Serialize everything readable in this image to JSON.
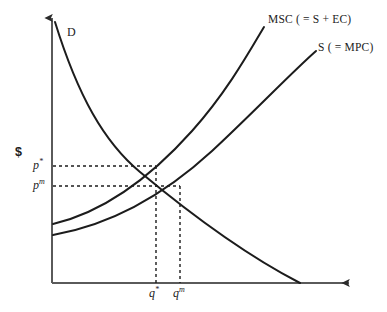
{
  "figure": {
    "title_internal": "negative-externality-supply-demand-diagram",
    "background_color": "#ffffff",
    "ink_color": "#1c1c1c"
  },
  "axes": {
    "y_label": "$",
    "x_label": "",
    "origin": {
      "x": 52,
      "y": 283
    },
    "y_top": {
      "x": 52,
      "y": 11
    },
    "x_right": {
      "x": 356,
      "y": 283
    },
    "arrowheads": [
      "y-axis-top",
      "x-axis-right"
    ]
  },
  "curves": [
    {
      "id": "demand",
      "label": "D",
      "label_x": 67,
      "label_y": 32,
      "kind": "downward-sloping-convex",
      "start": {
        "x": 55,
        "y": 22
      },
      "end": {
        "x": 300,
        "y": 283
      }
    },
    {
      "id": "marginal-social-cost",
      "label": "MSC ( = S + EC)",
      "label_x": 268,
      "label_y": 19,
      "kind": "upward-sloping-convex",
      "start": {
        "x": 53,
        "y": 224
      },
      "end": {
        "x": 264,
        "y": 27
      }
    },
    {
      "id": "supply-marginal-private-cost",
      "label": "S ( = MPC)",
      "label_x": 318,
      "label_y": 47,
      "kind": "upward-sloping-convex",
      "start": {
        "x": 53,
        "y": 235
      },
      "end": {
        "x": 316,
        "y": 51
      }
    }
  ],
  "equilibria": [
    {
      "id": "social-optimum",
      "price_label": "p",
      "price_superscript": "*",
      "quantity_label": "q",
      "quantity_superscript": "*",
      "point": {
        "x": 156,
        "y": 166
      },
      "price_label_x": 33,
      "price_label_y": 160,
      "quantity_label_x": 149,
      "quantity_label_y": 288
    },
    {
      "id": "market-equilibrium",
      "price_label": "p",
      "price_superscript": "m",
      "quantity_label": "q",
      "quantity_superscript": "m",
      "point": {
        "x": 180,
        "y": 186
      },
      "price_label_x": 33,
      "price_label_y": 180,
      "quantity_label_x": 173,
      "quantity_label_y": 288
    }
  ],
  "guidelines": {
    "style": "dashed",
    "dash_pattern": "3 3"
  }
}
